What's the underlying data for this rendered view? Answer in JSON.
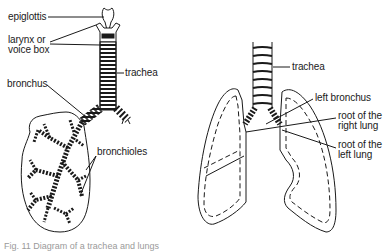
{
  "diagram": {
    "left_panel": {
      "name": "respiratory-tract-with-bronchial-tree",
      "labels": {
        "epiglottis": "epiglottis",
        "larynx_line1": "larynx or",
        "larynx_line2": "voice box",
        "trachea": "trachea",
        "bronchus": "bronchus",
        "bronchioles": "bronchioles"
      }
    },
    "right_panel": {
      "name": "lungs-front-view",
      "labels": {
        "trachea": "trachea",
        "left_bronchus": "left bronchus",
        "root_right_line1": "root of the",
        "root_right_line2": "right lung",
        "root_left_line1": "root of the",
        "root_left_line2": "left lung"
      }
    },
    "caption": "Fig. 11 Diagram of a trachea and lungs"
  },
  "colors": {
    "ink": "#1a1a1a",
    "background": "#ffffff",
    "caption": "#9a9a9a"
  }
}
